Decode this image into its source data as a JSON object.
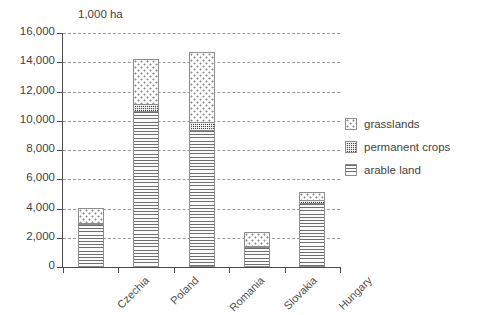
{
  "chart_data": {
    "type": "bar",
    "subtype": "stacked-bar",
    "title": "",
    "unit_label": "1,000 ha",
    "xlabel": "",
    "ylabel": "",
    "ylim": [
      0,
      16000
    ],
    "ytick_step": 2000,
    "ytick_labels": [
      "16,000",
      "14,000",
      "12,000",
      "10,000",
      "8,000",
      "6,000",
      "4,000",
      "2,000",
      "0"
    ],
    "ytick_values": [
      16000,
      14000,
      12000,
      10000,
      8000,
      6000,
      4000,
      2000,
      0
    ],
    "grid": "horizontal-dashed",
    "legend_position": "right",
    "categories": [
      "Czechia",
      "Poland",
      "Romania",
      "Slovakia",
      "Hungary"
    ],
    "series": [
      {
        "name": "arable land",
        "pattern": "horizontal-lines",
        "values": [
          2920,
          10700,
          9400,
          1350,
          4350
        ]
      },
      {
        "name": "permanent crops",
        "pattern": "dense-checker",
        "values": [
          100,
          450,
          500,
          110,
          250
        ]
      },
      {
        "name": "grasslands",
        "pattern": "sparse-dots",
        "values": [
          1010,
          3050,
          4800,
          940,
          500
        ]
      }
    ],
    "totals": [
      4030,
      14200,
      14700,
      2400,
      5100
    ]
  },
  "legend": {
    "items": [
      {
        "label": "grasslands"
      },
      {
        "label": "permanent crops"
      },
      {
        "label": "arable land"
      }
    ]
  },
  "colors": {
    "axis": "#4a4a4a",
    "gridline": "#9a9a9a",
    "text": "#3f3f3f",
    "bar_outline": "#8d8d8d",
    "arable_fill": "#f2f2f2",
    "permanent_crops_fill": "#4a4a4a",
    "grasslands_fill": "#fdfdfd"
  }
}
